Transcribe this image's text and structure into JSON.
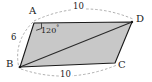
{
  "figure": {
    "shape_type": "parallelogram",
    "fill_color": "#c8c8c8",
    "stroke_color": "#1a1a1a",
    "dashed_color": "#999999",
    "background": "#ffffff",
    "vertices": [
      {
        "name": "A",
        "label": "A",
        "x": 34,
        "y": 23,
        "label_x": 29,
        "label_y": 8
      },
      {
        "name": "D",
        "label": "D",
        "x": 132,
        "y": 22,
        "label_x": 135,
        "label_y": 15
      },
      {
        "name": "C",
        "label": "C",
        "x": 115,
        "y": 63,
        "label_x": 118,
        "label_y": 60
      },
      {
        "name": "B",
        "label": "B",
        "x": 20,
        "y": 67,
        "label_x": 6,
        "label_y": 59
      }
    ],
    "edges": [
      {
        "name": "edge-AD",
        "from": "A",
        "to": "D"
      },
      {
        "name": "edge-DC",
        "from": "D",
        "to": "C"
      },
      {
        "name": "edge-CB",
        "from": "C",
        "to": "B"
      },
      {
        "name": "edge-BA",
        "from": "B",
        "to": "A"
      }
    ],
    "diagonal": {
      "name": "diagonal-BD",
      "from": "B",
      "to": "D"
    },
    "measurements": [
      {
        "name": "length-AD",
        "value": "10",
        "x": 77,
        "y": 5,
        "edge": "AD"
      },
      {
        "name": "length-AB",
        "value": "6",
        "x": 12,
        "y": 37,
        "edge": "AB"
      },
      {
        "name": "length-BC",
        "value": "10",
        "x": 63,
        "y": 73,
        "edge": "BC"
      }
    ],
    "angle": {
      "name": "angle-at-A",
      "vertex": "A",
      "value": "120",
      "unit": "°",
      "label_x": 41,
      "label_y": 26
    }
  }
}
